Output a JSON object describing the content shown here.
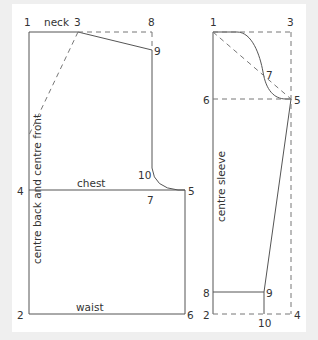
{
  "bodice": {
    "points": {
      "p1": "1",
      "p2": "2",
      "p3": "3",
      "p4": "4",
      "p5": "5",
      "p6": "6",
      "p7": "7",
      "p8": "8",
      "p9": "9",
      "p10": "10"
    },
    "labels": {
      "neck": "neck",
      "chest": "chest",
      "waist": "waist",
      "centre": "centre back and centre front"
    }
  },
  "sleeve": {
    "points": {
      "p1": "1",
      "p2": "2",
      "p3": "3",
      "p4": "4",
      "p5": "5",
      "p6": "6",
      "p7": "7",
      "p8": "8",
      "p9": "9",
      "p10": "10"
    },
    "labels": {
      "centre": "centre sleeve"
    }
  },
  "colors": {
    "background": "#efefef",
    "panel": "#ffffff",
    "line": "#555555",
    "text": "#333333"
  }
}
